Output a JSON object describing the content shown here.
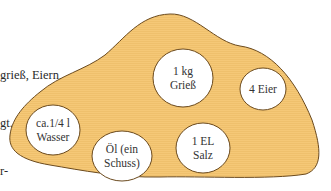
{
  "intro_text": [
    "grieß, Eiern,",
    "gt. Er",
    "r-"
  ],
  "colors": {
    "blob_fill": "#f5c877",
    "blob_stroke": "#6b4a1e",
    "circle_fill": "#ffffff"
  },
  "ingredients": [
    {
      "label": "1 kg\nGrieß",
      "line1": "1 kg",
      "line2": "Grieß"
    },
    {
      "label": "4 Eier",
      "line1": "4 Eier"
    },
    {
      "label": "ca.1/4 l\nWasser",
      "line1": "ca.1/4 l",
      "line2": "Wasser"
    },
    {
      "label": "Öl (ein\nSchuss)",
      "line1": "Öl (ein",
      "line2": "Schuss)"
    },
    {
      "label": "1 EL\nSalz",
      "line1": "1 EL",
      "line2": "Salz"
    }
  ]
}
